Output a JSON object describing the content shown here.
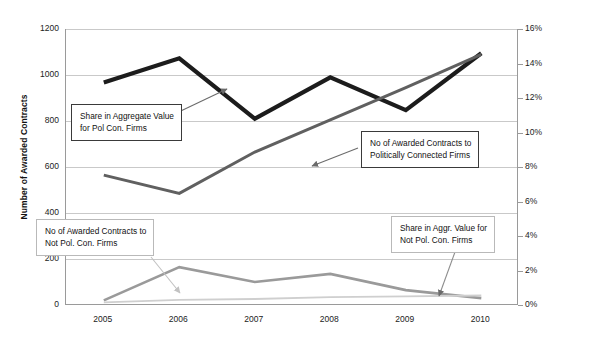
{
  "chart_data": {
    "type": "line",
    "title": "",
    "xlabel": "",
    "x": [
      "2005",
      "2006",
      "2007",
      "2008",
      "2009",
      "2010"
    ],
    "categories": [
      "2005",
      "2006",
      "2007",
      "2008",
      "2009",
      "2010"
    ],
    "grid": true,
    "legend_position": "inline-callouts",
    "axes": {
      "left": {
        "label": "Number of Awarded Contracts",
        "ticks": [
          "0",
          "200",
          "400",
          "600",
          "800",
          "1000",
          "1200"
        ],
        "tick_values": [
          0,
          200,
          400,
          600,
          800,
          1000,
          1200
        ],
        "ylim": [
          0,
          1200
        ]
      },
      "right": {
        "label": "Share in Aggregate Value of Awarded Contracts",
        "ticks": [
          "0%",
          "2%",
          "4%",
          "6%",
          "8%",
          "10%",
          "12%",
          "14%",
          "16%"
        ],
        "tick_values": [
          0,
          2,
          4,
          6,
          8,
          10,
          12,
          14,
          16
        ],
        "ylim": [
          0,
          16
        ]
      }
    },
    "series": [
      {
        "name": "Share in Aggregate Value for Pol Con. Firms",
        "axis": "right",
        "color": "#1c1c1c",
        "width": 4.2,
        "values": [
          12.9,
          14.3,
          10.8,
          13.2,
          11.3,
          14.6
        ]
      },
      {
        "name": "No of Awarded Contracts to Politically Connected Firms",
        "axis": "left",
        "color": "#606060",
        "width": 3.0,
        "values": [
          565,
          485,
          665,
          805,
          945,
          1090
        ]
      },
      {
        "name": "No of Awarded Contracts to Not Pol. Con. Firms",
        "axis": "left",
        "color": "#9a9a9a",
        "width": 2.6,
        "values": [
          20,
          165,
          100,
          135,
          65,
          30
        ]
      },
      {
        "name": "Share in Aggr. Value for Not Pol. Con. Firms",
        "axis": "right",
        "color": "#cfcfcf",
        "width": 1.8,
        "values": [
          0.15,
          0.3,
          0.35,
          0.45,
          0.5,
          0.55
        ]
      }
    ],
    "annotations": [
      {
        "id": "share-pc",
        "lines": [
          "Share in Aggregate Value",
          "for Pol Con. Firms"
        ],
        "style": "strong"
      },
      {
        "id": "num-pc",
        "lines": [
          "No of Awarded Contracts to",
          "Politically Connected Firms"
        ],
        "style": "strong"
      },
      {
        "id": "num-npc",
        "lines": [
          "No of Awarded Contracts to",
          "Not Pol. Con. Firms"
        ],
        "style": "light"
      },
      {
        "id": "share-npc",
        "lines": [
          "Share in Aggr. Value for",
          "Not Pol. Con. Firms"
        ],
        "style": "light"
      }
    ]
  }
}
